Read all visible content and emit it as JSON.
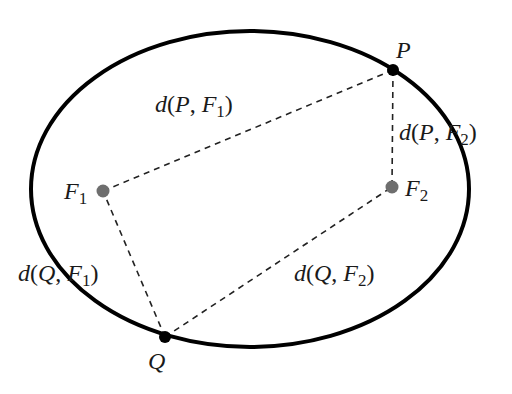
{
  "diagram": {
    "ellipse": {
      "cx": 250,
      "cy": 189,
      "rx": 219,
      "ry": 158,
      "stroke": "#000000",
      "stroke_width": 4
    },
    "points": {
      "P": {
        "x": 393,
        "y": 70,
        "color": "#000000",
        "label": "P"
      },
      "Q": {
        "x": 165,
        "y": 337,
        "color": "#000000",
        "label": "Q"
      },
      "F1": {
        "x": 103,
        "y": 191,
        "color": "#6e6e6e",
        "label": "F",
        "subscript": "1"
      },
      "F2": {
        "x": 392,
        "y": 187,
        "color": "#6e6e6e",
        "label": "F",
        "subscript": "2"
      }
    },
    "segments": [
      {
        "from": "P",
        "to": "F1",
        "label": {
          "fn": "d",
          "a": "P",
          "b": "F",
          "b_sub": "1"
        }
      },
      {
        "from": "P",
        "to": "F2",
        "label": {
          "fn": "d",
          "a": "P",
          "b": "F",
          "b_sub": "2"
        }
      },
      {
        "from": "Q",
        "to": "F1",
        "label": {
          "fn": "d",
          "a": "Q",
          "b": "F",
          "b_sub": "1"
        }
      },
      {
        "from": "Q",
        "to": "F2",
        "label": {
          "fn": "d",
          "a": "Q",
          "b": "F",
          "b_sub": "2"
        }
      }
    ],
    "punct": {
      "open": "(",
      "comma": ", ",
      "close": ")"
    },
    "dash_color": "#222222"
  }
}
